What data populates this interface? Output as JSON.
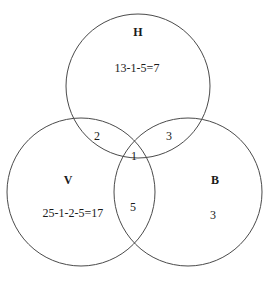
{
  "figure": {
    "type": "venn-diagram-3-set",
    "background_color": "#ffffff",
    "stroke_color": "#4a4a4a",
    "text_color": "#1a1a1a"
  },
  "sets": {
    "h": {
      "label": "H",
      "label_x": 138,
      "label_y": 32
    },
    "v": {
      "label": "V",
      "label_x": 68,
      "label_y": 180
    },
    "b": {
      "label": "B",
      "label_x": 215,
      "label_y": 180
    }
  },
  "regions": {
    "h_only": {
      "text": "13-1-5=7",
      "x": 137,
      "y": 68
    },
    "v_only": {
      "text": "25-1-2-5=17",
      "x": 73,
      "y": 213
    },
    "b_only": {
      "text": "3",
      "x": 213,
      "y": 215
    },
    "h_and_v": {
      "text": "2",
      "x": 97,
      "y": 136
    },
    "h_and_b": {
      "text": "3",
      "x": 169,
      "y": 136
    },
    "v_and_b": {
      "text": "5",
      "x": 133,
      "y": 207
    },
    "h_and_v_and_b": {
      "text": "1",
      "x": 134,
      "y": 156
    }
  },
  "circles": {
    "h": {
      "cx": 138,
      "cy": 86,
      "r": 72
    },
    "v": {
      "cx": 81,
      "cy": 192,
      "r": 74
    },
    "b": {
      "cx": 188,
      "cy": 192,
      "r": 74
    }
  }
}
